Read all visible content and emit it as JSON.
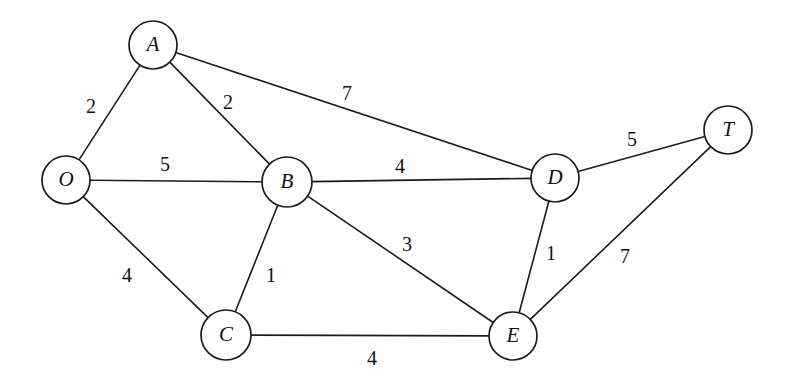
{
  "figure": {
    "kind": "weighted-undirected-graph",
    "width": 793,
    "height": 387,
    "background_color": "#ffffff",
    "stroke_color": "#1c1c1c",
    "text_color": "#111111"
  },
  "chart_data": {
    "type": "diagram",
    "title": "",
    "xlabel": "",
    "ylabel": "",
    "graph_kind": "weighted undirected graph",
    "directed": false,
    "nodes": [
      {
        "id": "O",
        "label": "O",
        "x": 66,
        "y": 180,
        "r": 24
      },
      {
        "id": "A",
        "label": "A",
        "x": 153,
        "y": 45,
        "r": 24
      },
      {
        "id": "B",
        "label": "B",
        "x": 287,
        "y": 182,
        "r": 25
      },
      {
        "id": "C",
        "label": "C",
        "x": 226,
        "y": 335,
        "r": 25
      },
      {
        "id": "D",
        "label": "D",
        "x": 555,
        "y": 178,
        "r": 24
      },
      {
        "id": "E",
        "label": "E",
        "x": 513,
        "y": 336,
        "r": 24
      },
      {
        "id": "T",
        "label": "T",
        "x": 728,
        "y": 130,
        "r": 24
      }
    ],
    "edges": [
      {
        "from": "O",
        "to": "A",
        "weight": 2,
        "label": "2",
        "lx": 91,
        "ly": 108
      },
      {
        "from": "A",
        "to": "B",
        "weight": 2,
        "label": "2",
        "lx": 228,
        "ly": 104
      },
      {
        "from": "A",
        "to": "D",
        "weight": 7,
        "label": "7",
        "lx": 347,
        "ly": 95
      },
      {
        "from": "O",
        "to": "B",
        "weight": 5,
        "label": "5",
        "lx": 165,
        "ly": 166
      },
      {
        "from": "B",
        "to": "D",
        "weight": 4,
        "label": "4",
        "lx": 400,
        "ly": 168
      },
      {
        "from": "D",
        "to": "T",
        "weight": 5,
        "label": "5",
        "lx": 632,
        "ly": 141
      },
      {
        "from": "O",
        "to": "C",
        "weight": 4,
        "label": "4",
        "lx": 127,
        "ly": 277
      },
      {
        "from": "B",
        "to": "C",
        "weight": 1,
        "label": "1",
        "lx": 271,
        "ly": 277
      },
      {
        "from": "B",
        "to": "E",
        "weight": 3,
        "label": "3",
        "lx": 407,
        "ly": 246
      },
      {
        "from": "D",
        "to": "E",
        "weight": 1,
        "label": "1",
        "lx": 551,
        "ly": 255
      },
      {
        "from": "E",
        "to": "T",
        "weight": 7,
        "label": "7",
        "lx": 625,
        "ly": 258
      },
      {
        "from": "C",
        "to": "E",
        "weight": 4,
        "label": "4",
        "lx": 372,
        "ly": 360
      }
    ]
  }
}
